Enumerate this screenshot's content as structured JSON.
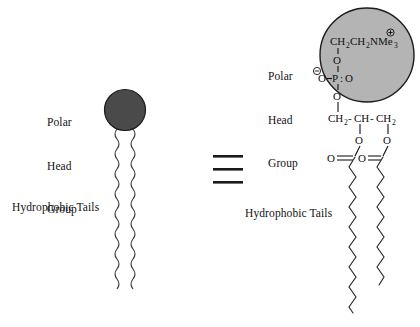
{
  "figure": {
    "type": "diagram",
    "background_color": "#ffffff",
    "ink_color": "#111111"
  },
  "left_schematic": {
    "head_label": "Polar\nHead\nGroup",
    "head_label_lines": [
      "Polar",
      "Head",
      "Group"
    ],
    "tails_label": "Hydrophobic Tails",
    "head_fill_color": "#4a4a4a",
    "head_stroke_color": "#222222",
    "head_center_x": 125,
    "head_center_y": 110,
    "head_radius": 20,
    "tail_count": 2,
    "tail_style": "wavy",
    "tail_top_y": 130,
    "tail_bottom_y": 292
  },
  "equivalence": {
    "symbol": "≡",
    "name": "identical-to-sign",
    "bar_count": 3,
    "center_x": 228,
    "center_y": 170
  },
  "right_structure": {
    "head_label": "Polar\nHead\nGroup",
    "head_label_lines": [
      "Polar",
      "Head",
      "Group"
    ],
    "tails_label": "Hydrophobic Tails",
    "head_fill_color": "#b4b4b4",
    "head_stroke_color": "#222222",
    "head_center_x": 367,
    "head_center_y": 55,
    "head_radius": 47,
    "choline": {
      "formula_parts": [
        {
          "text": "CH",
          "sub": false
        },
        {
          "text": "2",
          "sub": true
        },
        {
          "text": "CH",
          "sub": false
        },
        {
          "text": "2",
          "sub": true
        },
        {
          "text": "NMe",
          "sub": false
        },
        {
          "text": "3",
          "sub": true
        }
      ],
      "plain_text": "CH2CH2NMe3",
      "charge": "⊕",
      "charge_sign": "positive"
    },
    "phosphate": {
      "center_atom": "P",
      "top_oxygen": "O",
      "bottom_oxygen": "O",
      "left_oxygen": "O",
      "right_oxygen": "O",
      "left_charge": "⊖",
      "left_charge_sign": "negative",
      "right_bond_notation": ":",
      "plain_text": "O-P:O"
    },
    "glycerol": {
      "atoms": [
        "CH",
        "2",
        "CH",
        "CH",
        "2"
      ],
      "plain_text": "CH2-CH-CH2",
      "segments": [
        {
          "text": "CH",
          "sub": false
        },
        {
          "text": "2",
          "sub": true
        },
        {
          "text": "-",
          "sub": false
        },
        {
          "text": "CH",
          "sub": false
        },
        {
          "text": "-",
          "sub": false
        },
        {
          "text": "CH",
          "sub": false
        },
        {
          "text": "2",
          "sub": true
        }
      ]
    },
    "ester_oxygens": [
      "O",
      "O"
    ],
    "carbonyl_oxygens": [
      "O",
      "O"
    ],
    "carbonyl_left_text": "O",
    "carbonyl_right_text": "O",
    "tail_count": 2,
    "tail_style": "zigzag",
    "tail_left_bottom_y": 312,
    "tail_right_bottom_y": 285
  }
}
